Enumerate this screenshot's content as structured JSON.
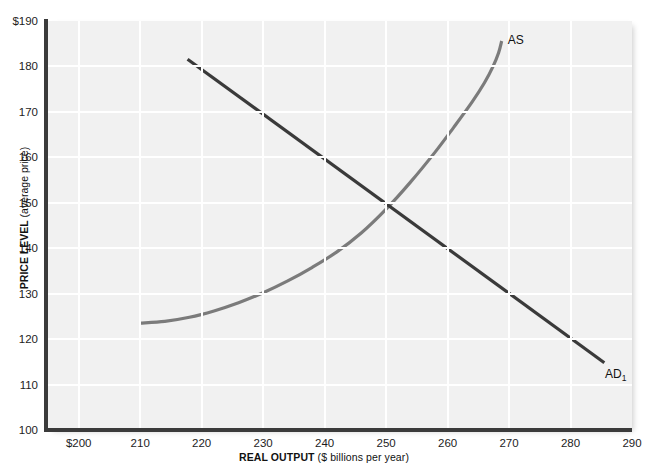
{
  "chart_data": {
    "type": "line",
    "title": "",
    "xlabel_bold": "REAL OUTPUT",
    "xlabel_rest": " ($ billions per year)",
    "ylabel_bold": "PRICE LEVEL",
    "ylabel_rest": " (average price)",
    "xlim": [
      195,
      290
    ],
    "ylim": [
      100,
      190
    ],
    "xticks": [
      "$200",
      "210",
      "220",
      "230",
      "240",
      "250",
      "260",
      "270",
      "280",
      "290"
    ],
    "xtick_values": [
      200,
      210,
      220,
      230,
      240,
      250,
      260,
      270,
      280,
      290
    ],
    "yticks": [
      "$190",
      "180",
      "170",
      "160",
      "150",
      "140",
      "130",
      "120",
      "110",
      "100"
    ],
    "ytick_values": [
      190,
      180,
      170,
      160,
      150,
      140,
      130,
      120,
      110,
      100
    ],
    "grid": true,
    "legend": "none",
    "plot_bg": "#f1f1f1",
    "grid_color": "#ffffff",
    "axis_color": "#3b3b3b",
    "series": [
      {
        "name": "AS",
        "label": "AS",
        "color": "#7b7b7b",
        "width": 3.2,
        "points": [
          [
            210.0,
            123.5
          ],
          [
            214.0,
            123.9
          ],
          [
            218.0,
            124.8
          ],
          [
            222.0,
            126.2
          ],
          [
            226.0,
            128.0
          ],
          [
            230.0,
            130.2
          ],
          [
            234.0,
            132.8
          ],
          [
            238.0,
            135.8
          ],
          [
            242.0,
            139.2
          ],
          [
            246.0,
            143.4
          ],
          [
            250.0,
            148.6
          ],
          [
            254.0,
            154.6
          ],
          [
            258.0,
            161.2
          ],
          [
            261.0,
            166.6
          ],
          [
            264.0,
            172.2
          ],
          [
            266.0,
            176.4
          ],
          [
            267.4,
            180.0
          ],
          [
            268.3,
            183.0
          ],
          [
            268.8,
            185.6
          ]
        ]
      },
      {
        "name": "AD1",
        "label": "AD",
        "label_sub": "1",
        "color": "#3a3a3a",
        "width": 3.2,
        "points": [
          [
            217.7,
            181.6
          ],
          [
            285.5,
            114.8
          ]
        ]
      }
    ],
    "annotations": [
      {
        "text": "AS",
        "x": 268.8,
        "y": 186.0,
        "name": "as-curve-label"
      },
      {
        "text": "AD",
        "sub": "1",
        "x": 286.6,
        "y": 112.0,
        "name": "ad-curve-label"
      }
    ],
    "equilibrium": {
      "x": 250,
      "y": 150
    }
  }
}
